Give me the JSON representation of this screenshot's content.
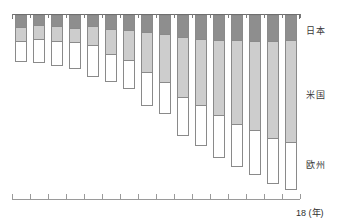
{
  "chart_data": {
    "type": "bar",
    "title": "",
    "subtitle": "",
    "orientation": "vertical-downward",
    "stacked": true,
    "grid": false,
    "legend_position": "right-axis-labels",
    "xlabel": "18 (年)",
    "ylabel": "",
    "x_axis_caption": "18 (年)",
    "x_axis_top_position": "top",
    "ylim": [
      0,
      100
    ],
    "categories": [
      "1",
      "2",
      "3",
      "4",
      "5",
      "6",
      "7",
      "8",
      "9",
      "10",
      "11",
      "12",
      "13",
      "14",
      "15",
      "16"
    ],
    "tick_labels_top": [
      "",
      "",
      "",
      "",
      "",
      "",
      "",
      "",
      "",
      "",
      "",
      "",
      "",
      "",
      "",
      ""
    ],
    "tick_labels_bottom": [
      "",
      "",
      "",
      "",
      "",
      "",
      "",
      "",
      "",
      "",
      "",
      "",
      "",
      "",
      "",
      ""
    ],
    "series": [
      {
        "name": "日本",
        "name_en": "Japan",
        "color": "#8e8e8e",
        "values": [
          11,
          9,
          10,
          12,
          10,
          13,
          14,
          16,
          18,
          21,
          23,
          24,
          24,
          25,
          25,
          24
        ]
      },
      {
        "name": "米国",
        "name_en": "United States",
        "color": "#cdcdcd",
        "values": [
          15,
          15,
          16,
          15,
          20,
          26,
          31,
          41,
          49,
          61,
          67,
          76,
          85,
          90,
          98,
          103
        ]
      },
      {
        "name": "欧州",
        "name_en": "Europe",
        "color": "#ffffff",
        "values": [
          21,
          24,
          25,
          27,
          32,
          28,
          29,
          34,
          32,
          39,
          41,
          43,
          43,
          45,
          46,
          48
        ]
      }
    ],
    "totals": [
      47,
      48,
      51,
      54,
      62,
      67,
      74,
      91,
      99,
      121,
      131,
      143,
      152,
      160,
      169,
      175
    ],
    "legend": [
      {
        "label": "日本",
        "color": "#8e8e8e"
      },
      {
        "label": "米国",
        "color": "#cdcdcd"
      },
      {
        "label": "欧州",
        "color": "#ffffff"
      }
    ]
  },
  "region_labels": [
    {
      "text": "日本",
      "top": 24
    },
    {
      "text": "米国",
      "top": 88
    },
    {
      "text": "欧州",
      "top": 158
    }
  ],
  "axis": {
    "caption": "18 (年)"
  }
}
